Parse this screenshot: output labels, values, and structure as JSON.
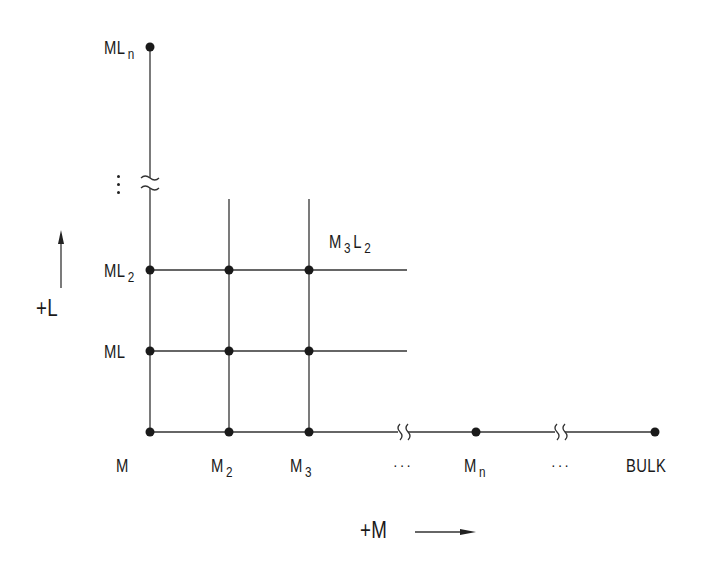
{
  "diagram": {
    "type": "grid-lattice",
    "colors": {
      "line": "#333333",
      "node": "#1a1a1a",
      "background": "#ffffff"
    },
    "axes": {
      "vertical": {
        "label": "+L",
        "direction": "up"
      },
      "horizontal": {
        "label": "+M",
        "direction": "right"
      }
    },
    "labels": {
      "ML_n": {
        "base": "ML",
        "sub": "n"
      },
      "ML_2": {
        "base": "ML",
        "sub": "2"
      },
      "ML": {
        "base": "ML",
        "sub": ""
      },
      "M": {
        "base": "M",
        "sub": ""
      },
      "M_2": {
        "base": "M",
        "sub": "2"
      },
      "M_3": {
        "base": "M",
        "sub": "3"
      },
      "M_n": {
        "base": "M",
        "sub": "n"
      },
      "M3L2": {
        "base1": "M",
        "sub1": "3",
        "base2": "L",
        "sub2": "2"
      },
      "bulk": "BULK",
      "ellipsis_1": "···",
      "ellipsis_2": "···"
    },
    "nodes": [
      {
        "id": "M",
        "x": 150,
        "y": 432
      },
      {
        "id": "M2",
        "x": 229,
        "y": 432
      },
      {
        "id": "M3",
        "x": 309,
        "y": 432
      },
      {
        "id": "Mn",
        "x": 476,
        "y": 432
      },
      {
        "id": "BULK",
        "x": 655,
        "y": 432
      },
      {
        "id": "ML",
        "x": 150,
        "y": 351
      },
      {
        "id": "M2L",
        "x": 229,
        "y": 351
      },
      {
        "id": "M3L",
        "x": 309,
        "y": 351
      },
      {
        "id": "ML2",
        "x": 150,
        "y": 270
      },
      {
        "id": "M2L2",
        "x": 229,
        "y": 270
      },
      {
        "id": "M3L2",
        "x": 309,
        "y": 270
      },
      {
        "id": "MLn",
        "x": 150,
        "y": 47
      }
    ],
    "breaks": [
      {
        "axis": "vertical",
        "x": 150,
        "y": 183
      },
      {
        "axis": "horizontal",
        "x": 403,
        "y": 432
      },
      {
        "axis": "horizontal",
        "x": 560,
        "y": 432
      }
    ]
  }
}
